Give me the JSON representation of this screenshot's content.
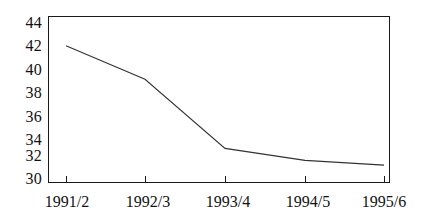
{
  "chart_data": {
    "type": "line",
    "title": "",
    "subtitle": "",
    "xlabel": "",
    "ylabel": "",
    "categories": [
      "1991/2",
      "1992/3",
      "1993/4",
      "1994/5",
      "1995/6"
    ],
    "values": [
      41.5,
      38.7,
      32.9,
      31.9,
      31.5
    ],
    "series": [
      {
        "name": "",
        "values": [
          41.5,
          38.7,
          32.9,
          31.9,
          31.5
        ]
      }
    ],
    "ylim": [
      30,
      44
    ],
    "yticks": [
      30,
      32,
      34,
      36,
      38,
      40,
      42,
      44
    ],
    "ytick_labels": [
      "30",
      "32",
      "34",
      "36",
      "38",
      "40",
      "42",
      "44"
    ],
    "xticks": [
      "1991/2",
      "1992/3",
      "1993/4",
      "1994/5",
      "1995/6"
    ],
    "grid": false,
    "legend": false,
    "legend_position": "none",
    "annotations": [],
    "line_color": "#333333",
    "axis_color": "#1a1a1a",
    "background_color": "#ffffff"
  }
}
